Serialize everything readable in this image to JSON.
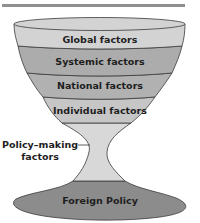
{
  "diagram": {
    "layers": [
      {
        "label": "Global factors",
        "color": "#d3d3d3"
      },
      {
        "label": "Systemic factors",
        "color": "#acacac"
      },
      {
        "label": "National factors",
        "color": "#b1b1b1"
      },
      {
        "label": "Individual factors",
        "color": "#c6c6c6"
      }
    ],
    "stem": {
      "label_line1": "Policy–making",
      "label_line2": "factors",
      "color": "#d8d8d8"
    },
    "base": {
      "label": "Foreign Policy",
      "color": "#8c8c8c"
    },
    "rule_color": "#8f8f8f",
    "outline_color": "#3a3a3a"
  }
}
